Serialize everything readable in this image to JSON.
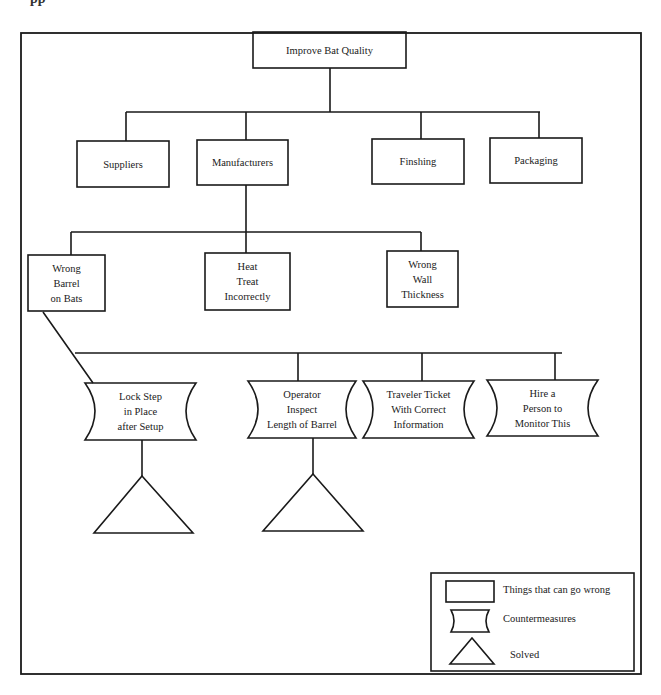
{
  "cropped_heading_fragment": "pp",
  "diagram": {
    "type": "tree",
    "root": {
      "id": "root",
      "label": "Improve Bat Quality"
    },
    "categories": [
      {
        "id": "suppliers",
        "label": "Suppliers"
      },
      {
        "id": "manufacturers",
        "label": "Manufacturers"
      },
      {
        "id": "finishing",
        "label": "Finshing"
      },
      {
        "id": "packaging",
        "label": "Packaging"
      }
    ],
    "problems": [
      {
        "id": "wrong-barrel",
        "lines": [
          "Wrong",
          "Barrel",
          "on Bats"
        ]
      },
      {
        "id": "heat-treat",
        "lines": [
          "Heat",
          "Treat",
          "Incorrectly"
        ]
      },
      {
        "id": "wall-thickness",
        "lines": [
          "Wrong",
          "Wall",
          "Thickness"
        ]
      }
    ],
    "countermeasures": [
      {
        "id": "lock-step",
        "lines": [
          "Lock Step",
          "in Place",
          "after Setup"
        ],
        "solved": true
      },
      {
        "id": "operator-inspect",
        "lines": [
          "Operator",
          "Inspect",
          "Length of Barrel"
        ],
        "solved": true
      },
      {
        "id": "traveler-ticket",
        "lines": [
          "Traveler Ticket",
          "With Correct",
          "Information"
        ],
        "solved": false
      },
      {
        "id": "hire-person",
        "lines": [
          "Hire a",
          "Person to",
          "Monitor This"
        ],
        "solved": false
      }
    ],
    "edges": [
      [
        "root",
        "suppliers"
      ],
      [
        "root",
        "manufacturers"
      ],
      [
        "root",
        "finishing"
      ],
      [
        "root",
        "packaging"
      ],
      [
        "manufacturers",
        "wrong-barrel"
      ],
      [
        "manufacturers",
        "heat-treat"
      ],
      [
        "manufacturers",
        "wall-thickness"
      ],
      [
        "wrong-barrel",
        "lock-step"
      ],
      [
        "wrong-barrel",
        "operator-inspect"
      ],
      [
        "wrong-barrel",
        "traveler-ticket"
      ],
      [
        "wrong-barrel",
        "hire-person"
      ],
      [
        "lock-step",
        "solved"
      ],
      [
        "operator-inspect",
        "solved"
      ]
    ]
  },
  "legend": {
    "items": [
      {
        "shape": "rectangle",
        "label": "Things that can go wrong"
      },
      {
        "shape": "countermeasure",
        "label": "Countermeasures"
      },
      {
        "shape": "triangle",
        "label": "Solved"
      }
    ]
  },
  "colors": {
    "stroke": "#1a1a1a",
    "background": "#ffffff"
  }
}
